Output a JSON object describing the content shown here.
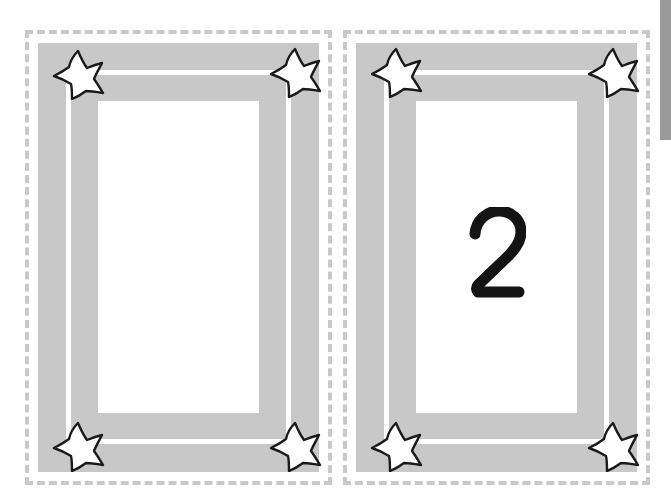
{
  "page": {
    "background_color": "#ffffff",
    "width": 671,
    "height": 501
  },
  "theme": {
    "frame_color": "#c8c8c8",
    "cut_line_color": "#c9c9c9",
    "card_background": "#ffffff",
    "number_color": "#141414",
    "star_fill": "#ffffff",
    "star_stroke": "#1a1a1a",
    "scrollbar_thumb_color": "#9a9a9a"
  },
  "cards": [
    {
      "id": "card-1",
      "number": "1",
      "number_style": "stroke",
      "stars": [
        {
          "position": "top-left",
          "name": "star-top-left"
        },
        {
          "position": "top-right",
          "name": "star-top-right"
        },
        {
          "position": "bottom-left",
          "name": "star-bottom-left"
        },
        {
          "position": "bottom-right",
          "name": "star-bottom-right"
        }
      ]
    },
    {
      "id": "card-2",
      "number": "2",
      "number_style": "glyph",
      "stars": [
        {
          "position": "top-left",
          "name": "star-top-left"
        },
        {
          "position": "top-right",
          "name": "star-top-right"
        },
        {
          "position": "bottom-left",
          "name": "star-bottom-left"
        },
        {
          "position": "bottom-right",
          "name": "star-bottom-right"
        }
      ]
    }
  ],
  "scrollbar": {
    "orientation": "vertical",
    "thumb_top": 0,
    "thumb_height": 140
  }
}
